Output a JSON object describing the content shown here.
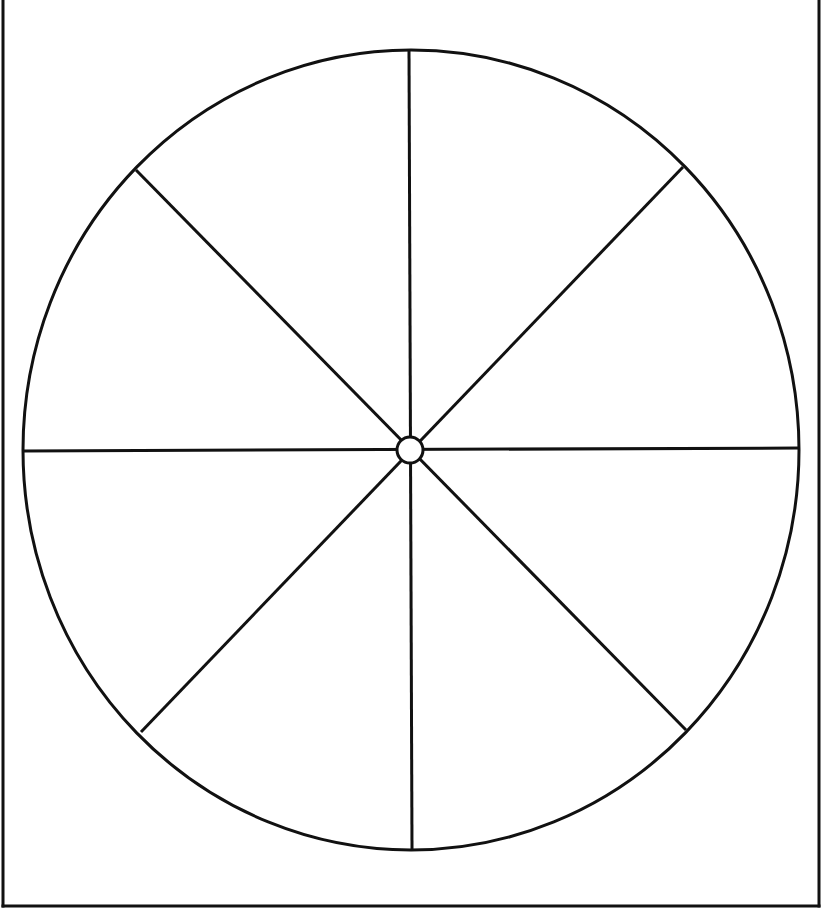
{
  "diagram": {
    "type": "segmented-circle",
    "segment_count": 8,
    "colors": {
      "background": "#ffffff",
      "stroke": "#111111",
      "frame": "#111111"
    },
    "frame": {
      "left_x": 3,
      "right_x": 819,
      "bottom_y": 906,
      "top_open": true,
      "stroke_width": 3
    },
    "outer_circle": {
      "cx": 411,
      "cy": 450,
      "rx": 388,
      "ry": 400,
      "stroke_width": 3
    },
    "hub": {
      "cx": 410,
      "cy": 450,
      "r": 13,
      "stroke_width": 3
    },
    "spokes": [
      {
        "id": "vertical",
        "x1": 409,
        "y1": 50,
        "x2": 412,
        "y2": 849
      },
      {
        "id": "horizontal",
        "x1": 23,
        "y1": 451,
        "x2": 799,
        "y2": 448
      },
      {
        "id": "diagonal-main",
        "x1": 136,
        "y1": 170,
        "x2": 686,
        "y2": 730
      },
      {
        "id": "diagonal-anti",
        "x1": 683,
        "y1": 167,
        "x2": 141,
        "y2": 732
      }
    ],
    "segments": [
      {
        "id": "segment-1",
        "label": ""
      },
      {
        "id": "segment-2",
        "label": ""
      },
      {
        "id": "segment-3",
        "label": ""
      },
      {
        "id": "segment-4",
        "label": ""
      },
      {
        "id": "segment-5",
        "label": ""
      },
      {
        "id": "segment-6",
        "label": ""
      },
      {
        "id": "segment-7",
        "label": ""
      },
      {
        "id": "segment-8",
        "label": ""
      }
    ]
  }
}
